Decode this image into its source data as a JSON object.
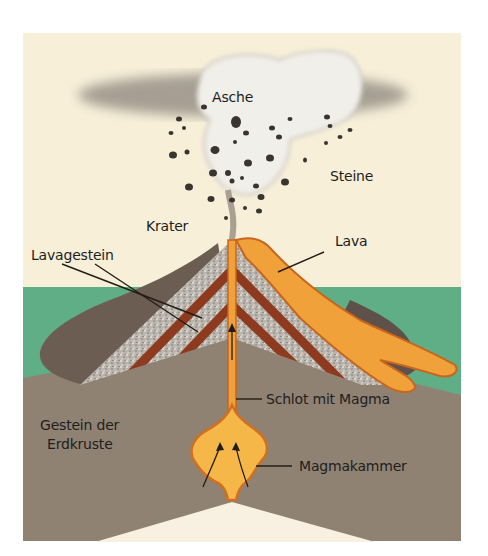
{
  "diagram": {
    "type": "volcano-cross-section",
    "colors": {
      "sky": "#f7efd8",
      "ground_green": "#5fae86",
      "crust": "#8f8273",
      "ash_cloud": "#9e968c",
      "lava": "#f0a13a",
      "lava_dark": "#c8651e",
      "lava_rock_bands": "#8e3a1e",
      "tephra_layers": "#b7b2ab",
      "magma_chamber": "#f5b748",
      "page_cutout": "#f8f1e2"
    },
    "labels": {
      "ash": "Asche",
      "stones": "Steine",
      "crater": "Krater",
      "lava": "Lava",
      "lava_rock": "Lavagestein",
      "vent": "Schlot mit Magma",
      "crust_line1": "Gestein der",
      "crust_line2": "Erdkruste",
      "magma_chamber": "Magmakammer"
    }
  }
}
